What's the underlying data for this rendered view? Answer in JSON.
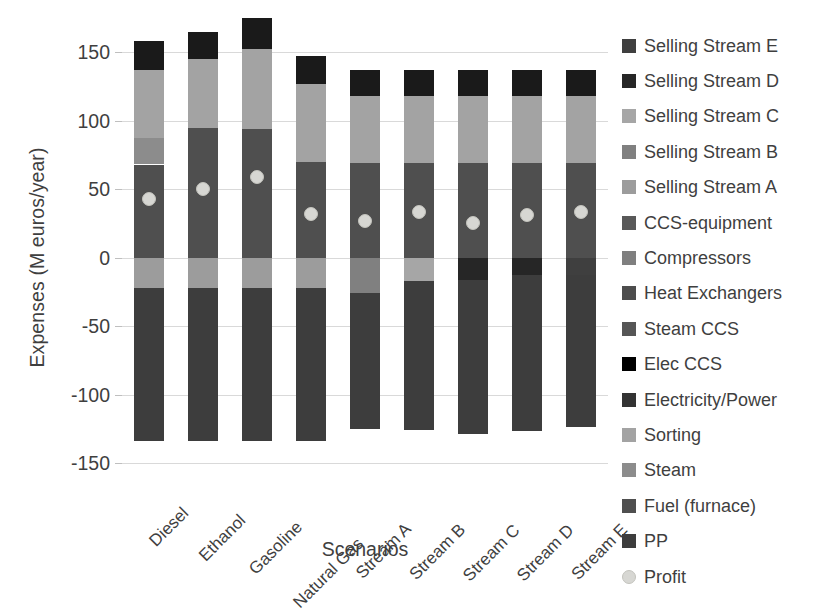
{
  "chart_data": {
    "type": "bar",
    "subtype": "stacked-bar-with-scatter-overlay",
    "title": "",
    "xlabel": "Scenarios",
    "ylabel": "Expenses (M euros/year)",
    "ylim": [
      -150,
      175
    ],
    "yticks": [
      150,
      100,
      50,
      0,
      -50,
      -100,
      -150
    ],
    "ytick_labels": [
      "150",
      "100",
      "50",
      "0",
      "-50",
      "-100",
      "-150"
    ],
    "grid": true,
    "legend_position": "right",
    "categories": [
      "Diesel",
      "Ethanol",
      "Gasoline",
      "Natural Gas",
      "Stream A",
      "Stream B",
      "Stream C",
      "Stream D",
      "Stream E"
    ],
    "series": [
      {
        "name": "Selling Stream E",
        "color": "#3f3f3f",
        "values": [
          0,
          0,
          0,
          0,
          0,
          0,
          0,
          0,
          -13
        ]
      },
      {
        "name": "Selling Stream D",
        "color": "#262626",
        "values": [
          0,
          0,
          0,
          0,
          0,
          0,
          -16,
          -13,
          0
        ]
      },
      {
        "name": "Selling Stream C",
        "color": "#a6a6a6",
        "values": [
          0,
          0,
          0,
          0,
          0,
          -17,
          0,
          0,
          0
        ]
      },
      {
        "name": "Selling Stream B",
        "color": "#808080",
        "values": [
          0,
          0,
          0,
          0,
          -26,
          0,
          0,
          0,
          0
        ]
      },
      {
        "name": "Selling Stream A",
        "color": "#9c9c9c",
        "values": [
          -22,
          -22,
          -22,
          -22,
          0,
          0,
          0,
          0,
          0
        ]
      },
      {
        "name": "CCS-equipment",
        "color": "#595959",
        "values": [
          0,
          0,
          0,
          0,
          0,
          0,
          0,
          0,
          0
        ]
      },
      {
        "name": "Compressors",
        "color": "#7f7f7f",
        "values": [
          0,
          0,
          0,
          0,
          0,
          0,
          0,
          0,
          0
        ]
      },
      {
        "name": "Heat Exchangers",
        "color": "#4d4d4d",
        "values": [
          0,
          0,
          0,
          0,
          0,
          0,
          0,
          0,
          0
        ]
      },
      {
        "name": "Steam CCS",
        "color": "#565656",
        "values": [
          0,
          0,
          0,
          0,
          0,
          0,
          0,
          0,
          0
        ]
      },
      {
        "name": "Elec CCS",
        "color": "#000000",
        "values": [
          21,
          20,
          23,
          20,
          19,
          19,
          19,
          19,
          19
        ]
      },
      {
        "name": "Electricity/Power",
        "color": "#333333",
        "values": [
          0,
          0,
          0,
          0,
          0,
          0,
          0,
          0,
          0
        ]
      },
      {
        "name": "Sorting",
        "color": "#a3a3a3",
        "values": [
          50,
          59,
          58,
          57,
          49,
          49,
          49,
          49,
          49
        ]
      },
      {
        "name": "Steam",
        "color": "#8c8c8c",
        "values": [
          19,
          0,
          0,
          0,
          0,
          0,
          0,
          0,
          0
        ]
      },
      {
        "name": "Fuel (furnace)",
        "color": "#4f4f4f",
        "values": [
          68,
          86,
          95,
          70,
          69,
          69,
          69,
          69,
          69
        ]
      },
      {
        "name": "PP",
        "color": "#3d3d3d",
        "values": [
          -112,
          -112,
          -112,
          -112,
          -99,
          -109,
          -113,
          -114,
          -111
        ]
      }
    ],
    "profit_marker": {
      "name": "Profit",
      "color": "#d7d7d3",
      "values": [
        43,
        50,
        59,
        32,
        27,
        33,
        25,
        31,
        33
      ]
    },
    "stacks": [
      {
        "category": "Diesel",
        "positive_total": 158,
        "negative_total": -134,
        "segments_positive": [
          {
            "name": "Fuel (furnace)",
            "from": 0,
            "to": 68,
            "color": "#4f4f4f"
          },
          {
            "name": "Steam",
            "from": 68,
            "to": 87,
            "color": "#8c8c8c"
          },
          {
            "name": "Sorting",
            "from": 87,
            "to": 137,
            "color": "#a3a3a3"
          },
          {
            "name": "Elec CCS",
            "from": 137,
            "to": 158,
            "color": "#1a1a1a"
          }
        ],
        "segments_negative": [
          {
            "name": "Selling Stream A",
            "from": 0,
            "to": -22,
            "color": "#9c9c9c"
          },
          {
            "name": "PP",
            "from": -22,
            "to": -134,
            "color": "#3d3d3d"
          }
        ]
      },
      {
        "category": "Ethanol",
        "positive_total": 165,
        "negative_total": -134,
        "segments_positive": [
          {
            "name": "Fuel (furnace)",
            "from": 0,
            "to": 95,
            "color": "#4f4f4f"
          },
          {
            "name": "Sorting",
            "from": 95,
            "to": 145,
            "color": "#a3a3a3"
          },
          {
            "name": "Elec CCS",
            "from": 145,
            "to": 165,
            "color": "#1a1a1a"
          }
        ],
        "segments_negative": [
          {
            "name": "Selling Stream A",
            "from": 0,
            "to": -22,
            "color": "#9c9c9c"
          },
          {
            "name": "PP",
            "from": -22,
            "to": -134,
            "color": "#3d3d3d"
          }
        ]
      },
      {
        "category": "Gasoline",
        "positive_total": 175,
        "negative_total": -134,
        "segments_positive": [
          {
            "name": "Fuel (furnace)",
            "from": 0,
            "to": 94,
            "color": "#4f4f4f"
          },
          {
            "name": "Sorting",
            "from": 94,
            "to": 152,
            "color": "#a3a3a3"
          },
          {
            "name": "Elec CCS",
            "from": 152,
            "to": 175,
            "color": "#1a1a1a"
          }
        ],
        "segments_negative": [
          {
            "name": "Selling Stream A",
            "from": 0,
            "to": -22,
            "color": "#9c9c9c"
          },
          {
            "name": "PP",
            "from": -22,
            "to": -134,
            "color": "#3d3d3d"
          }
        ]
      },
      {
        "category": "Natural Gas",
        "positive_total": 147,
        "negative_total": -134,
        "segments_positive": [
          {
            "name": "Fuel (furnace)",
            "from": 0,
            "to": 70,
            "color": "#4f4f4f"
          },
          {
            "name": "Sorting",
            "from": 70,
            "to": 127,
            "color": "#a3a3a3"
          },
          {
            "name": "Elec CCS",
            "from": 127,
            "to": 147,
            "color": "#1a1a1a"
          }
        ],
        "segments_negative": [
          {
            "name": "Selling Stream A",
            "from": 0,
            "to": -22,
            "color": "#9c9c9c"
          },
          {
            "name": "PP",
            "from": -22,
            "to": -134,
            "color": "#3d3d3d"
          }
        ]
      },
      {
        "category": "Stream A",
        "positive_total": 137,
        "negative_total": -125,
        "segments_positive": [
          {
            "name": "Fuel (furnace)",
            "from": 0,
            "to": 69,
            "color": "#4f4f4f"
          },
          {
            "name": "Sorting",
            "from": 69,
            "to": 118,
            "color": "#a3a3a3"
          },
          {
            "name": "Elec CCS",
            "from": 118,
            "to": 137,
            "color": "#1a1a1a"
          }
        ],
        "segments_negative": [
          {
            "name": "Selling Stream B",
            "from": 0,
            "to": -26,
            "color": "#808080"
          },
          {
            "name": "PP",
            "from": -26,
            "to": -125,
            "color": "#3d3d3d"
          }
        ]
      },
      {
        "category": "Stream B",
        "positive_total": 137,
        "negative_total": -126,
        "segments_positive": [
          {
            "name": "Fuel (furnace)",
            "from": 0,
            "to": 69,
            "color": "#4f4f4f"
          },
          {
            "name": "Sorting",
            "from": 69,
            "to": 118,
            "color": "#a3a3a3"
          },
          {
            "name": "Elec CCS",
            "from": 118,
            "to": 137,
            "color": "#1a1a1a"
          }
        ],
        "segments_negative": [
          {
            "name": "Selling Stream C",
            "from": 0,
            "to": -17,
            "color": "#a6a6a6"
          },
          {
            "name": "PP",
            "from": -17,
            "to": -126,
            "color": "#3d3d3d"
          }
        ]
      },
      {
        "category": "Stream C",
        "positive_total": 137,
        "negative_total": -129,
        "segments_positive": [
          {
            "name": "Fuel (furnace)",
            "from": 0,
            "to": 69,
            "color": "#4f4f4f"
          },
          {
            "name": "Sorting",
            "from": 69,
            "to": 118,
            "color": "#a3a3a3"
          },
          {
            "name": "Elec CCS",
            "from": 118,
            "to": 137,
            "color": "#1a1a1a"
          }
        ],
        "segments_negative": [
          {
            "name": "Selling Stream D",
            "from": 0,
            "to": -16,
            "color": "#262626"
          },
          {
            "name": "PP",
            "from": -16,
            "to": -129,
            "color": "#3d3d3d"
          }
        ]
      },
      {
        "category": "Stream D",
        "positive_total": 137,
        "negative_total": -127,
        "segments_positive": [
          {
            "name": "Fuel (furnace)",
            "from": 0,
            "to": 69,
            "color": "#4f4f4f"
          },
          {
            "name": "Sorting",
            "from": 69,
            "to": 118,
            "color": "#a3a3a3"
          },
          {
            "name": "Elec CCS",
            "from": 118,
            "to": 137,
            "color": "#1a1a1a"
          }
        ],
        "segments_negative": [
          {
            "name": "Selling Stream D",
            "from": 0,
            "to": -13,
            "color": "#262626"
          },
          {
            "name": "PP",
            "from": -13,
            "to": -127,
            "color": "#3d3d3d"
          }
        ]
      },
      {
        "category": "Stream E",
        "positive_total": 137,
        "negative_total": -124,
        "segments_positive": [
          {
            "name": "Fuel (furnace)",
            "from": 0,
            "to": 69,
            "color": "#4f4f4f"
          },
          {
            "name": "Sorting",
            "from": 69,
            "to": 118,
            "color": "#a3a3a3"
          },
          {
            "name": "Elec CCS",
            "from": 118,
            "to": 137,
            "color": "#1a1a1a"
          }
        ],
        "segments_negative": [
          {
            "name": "Selling Stream E",
            "from": 0,
            "to": -13,
            "color": "#3f3f3f"
          },
          {
            "name": "PP",
            "from": -13,
            "to": -124,
            "color": "#3d3d3d"
          }
        ]
      }
    ],
    "legend": [
      {
        "label": "Selling Stream E",
        "color": "#3f3f3f",
        "shape": "square"
      },
      {
        "label": "Selling Stream D",
        "color": "#262626",
        "shape": "square"
      },
      {
        "label": "Selling Stream C",
        "color": "#a6a6a6",
        "shape": "square"
      },
      {
        "label": "Selling Stream B",
        "color": "#808080",
        "shape": "square"
      },
      {
        "label": "Selling Stream A",
        "color": "#9c9c9c",
        "shape": "square"
      },
      {
        "label": "CCS-equipment",
        "color": "#595959",
        "shape": "square"
      },
      {
        "label": "Compressors",
        "color": "#7f7f7f",
        "shape": "square"
      },
      {
        "label": "Heat Exchangers",
        "color": "#4d4d4d",
        "shape": "square"
      },
      {
        "label": "Steam CCS",
        "color": "#565656",
        "shape": "square"
      },
      {
        "label": "Elec CCS",
        "color": "#000000",
        "shape": "square"
      },
      {
        "label": "Electricity/Power",
        "color": "#333333",
        "shape": "square"
      },
      {
        "label": "Sorting",
        "color": "#a3a3a3",
        "shape": "square"
      },
      {
        "label": "Steam",
        "color": "#8c8c8c",
        "shape": "square"
      },
      {
        "label": "Fuel (furnace)",
        "color": "#4f4f4f",
        "shape": "square"
      },
      {
        "label": "PP",
        "color": "#3d3d3d",
        "shape": "square"
      },
      {
        "label": "Profit",
        "color": "#d7d7d3",
        "shape": "circle"
      }
    ]
  }
}
